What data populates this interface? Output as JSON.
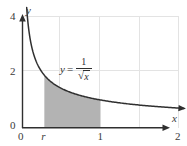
{
  "figure": {
    "background_color": "#ffffff"
  },
  "axes": {
    "x_axis_name": "x",
    "y_axis_name": "y",
    "x_ticks": [
      {
        "label": "0",
        "value": 0
      },
      {
        "label": "r",
        "value": 0.28
      },
      {
        "label": "1",
        "value": 1
      },
      {
        "label": "2",
        "value": 2
      }
    ],
    "y_ticks": [
      {
        "label": "0",
        "value": 0
      },
      {
        "label": "2",
        "value": 2
      },
      {
        "label": "4",
        "value": 4
      }
    ]
  },
  "equation": {
    "lhs": "y",
    "equals": "=",
    "numerator": "1",
    "radical_sign": "√",
    "radicand": "x"
  },
  "colors": {
    "curve": "#2f2f2f",
    "axis": "#2f2f2f",
    "gridline": "#e0e0e0",
    "shaded_region": "#b3b3b3",
    "text": "#3a3a3a"
  },
  "chart_data": {
    "type": "line",
    "title": "",
    "xlabel": "x",
    "ylabel": "y",
    "xlim": [
      0,
      2.2
    ],
    "ylim": [
      0,
      4.4
    ],
    "grid": true,
    "legend": null,
    "function": "y = 1/sqrt(x)",
    "annotations": [
      {
        "text": "y = 1/√x",
        "x": 0.72,
        "y": 1.55
      }
    ],
    "shaded_region": {
      "label": "area under curve from r to 1",
      "x_start_label": "r",
      "x_start": 0.28,
      "x_end_label": "1",
      "x_end": 1,
      "color": "#b3b3b3"
    },
    "x": [
      0.055,
      0.08,
      0.11,
      0.15,
      0.2,
      0.28,
      0.35,
      0.45,
      0.55,
      0.7,
      0.85,
      1.0,
      1.2,
      1.4,
      1.6,
      1.8,
      2.0
    ],
    "y": [
      4.26,
      3.54,
      3.02,
      2.58,
      2.24,
      1.89,
      1.69,
      1.49,
      1.35,
      1.2,
      1.08,
      1.0,
      0.91,
      0.85,
      0.79,
      0.75,
      0.71
    ],
    "x_gridlines": [
      0.5,
      1.0,
      1.5,
      2.0
    ],
    "y_gridlines": [
      2,
      4
    ]
  }
}
